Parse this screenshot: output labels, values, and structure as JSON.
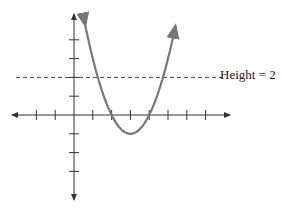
{
  "chart_data": {
    "type": "line",
    "title": "",
    "xlabel": "",
    "ylabel": "",
    "function": "y = (x - 3)^2 - 1",
    "series": [
      {
        "name": "parabola",
        "x": [
          0.6,
          1,
          1.27,
          2,
          3,
          4,
          4.73,
          5,
          5.4
        ],
        "y": [
          4.76,
          3,
          2,
          0,
          -1,
          0,
          2,
          3,
          4.76
        ]
      }
    ],
    "reference_lines": [
      {
        "type": "horizontal",
        "y": 2,
        "style": "dashed",
        "label": "Height = 2"
      }
    ],
    "xlim": [
      -3.5,
      8.5
    ],
    "ylim": [
      -4.5,
      5.5
    ],
    "x_ticks": [
      -2,
      -1,
      1,
      2,
      3,
      4,
      5,
      6,
      7
    ],
    "y_ticks": [
      -3,
      -2,
      -1,
      1,
      2,
      3,
      4
    ],
    "grid": false,
    "legend": "none"
  },
  "annotation": {
    "height_label": "Height = 2"
  },
  "colors": {
    "curve": "#777777",
    "axis": "#333333",
    "dashed": "#444444"
  }
}
